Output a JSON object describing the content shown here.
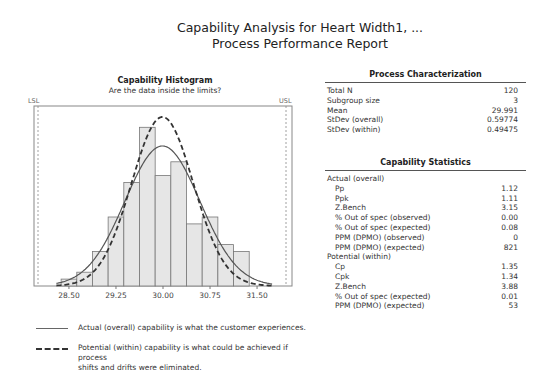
{
  "report": {
    "title": "Capability Analysis for Heart Width1, ...",
    "subtitle": "Process Performance Report"
  },
  "histogram": {
    "title": "Capability Histogram",
    "subtitle": "Are the data inside the limits?",
    "lsl_label": "LSL",
    "usl_label": "USL",
    "ticks": [
      "28.50",
      "29.25",
      "30.00",
      "30.75",
      "31.50"
    ]
  },
  "legend": {
    "actual": "Actual (overall) capability is what the customer experiences.",
    "potential_line1": "Potential (within) capability is what could be achieved if process",
    "potential_line2": "shifts and drifts were eliminated."
  },
  "process_characterization": {
    "title": "Process Characterization",
    "rows": [
      {
        "label": "Total N",
        "value": "120"
      },
      {
        "label": "Subgroup size",
        "value": "3"
      },
      {
        "label": "Mean",
        "value": "29.991"
      },
      {
        "label": "StDev (overall)",
        "value": "0.59774"
      },
      {
        "label": "StDev (within)",
        "value": "0.49475"
      }
    ]
  },
  "capability_statistics": {
    "title": "Capability Statistics",
    "actual_header": "Actual (overall)",
    "actual_rows": [
      {
        "label": "Pp",
        "value": "1.12"
      },
      {
        "label": "Ppk",
        "value": "1.11"
      },
      {
        "label": "Z.Bench",
        "value": "3.15"
      },
      {
        "label": "% Out of spec (observed)",
        "value": "0.00"
      },
      {
        "label": "% Out of spec (expected)",
        "value": "0.08"
      },
      {
        "label": "PPM (DPMO) (observed)",
        "value": "0"
      },
      {
        "label": "PPM (DPMO) (expected)",
        "value": "821"
      }
    ],
    "potential_header": "Potential (within)",
    "potential_rows": [
      {
        "label": "Cp",
        "value": "1.35"
      },
      {
        "label": "Cpk",
        "value": "1.34"
      },
      {
        "label": "Z.Bench",
        "value": "3.88"
      },
      {
        "label": "% Out of spec (expected)",
        "value": "0.01"
      },
      {
        "label": "PPM (DPMO) (expected)",
        "value": "53"
      }
    ]
  },
  "chart_data": {
    "type": "bar",
    "title": "Capability Histogram",
    "subtitle": "Are the data inside the limits?",
    "xlabel": "",
    "ylabel": "",
    "bin_width": 0.25,
    "bin_starts": [
      28.375,
      28.625,
      28.875,
      29.125,
      29.375,
      29.625,
      29.875,
      30.125,
      30.375,
      30.625,
      30.875,
      31.125
    ],
    "categories": [
      "28.50",
      "28.75",
      "29.00",
      "29.25",
      "29.50",
      "29.75",
      "30.00",
      "30.25",
      "30.50",
      "30.75",
      "31.00",
      "31.25"
    ],
    "values": [
      1,
      2,
      5,
      10,
      15,
      23,
      16,
      18,
      9,
      10,
      6,
      5
    ],
    "xlim": [
      27.95,
      32.05
    ],
    "x_ticks": [
      28.5,
      29.25,
      30.0,
      30.75,
      31.5
    ],
    "lsl": 28.0,
    "usl": 31.95,
    "series": [
      {
        "name": "Actual (overall)",
        "type": "normal_curve",
        "mean": 29.991,
        "sd": 0.59774,
        "style": "solid"
      },
      {
        "name": "Potential (within)",
        "type": "normal_curve",
        "mean": 29.991,
        "sd": 0.49475,
        "style": "dashed"
      }
    ],
    "grid": false,
    "legend_position": "bottom"
  }
}
